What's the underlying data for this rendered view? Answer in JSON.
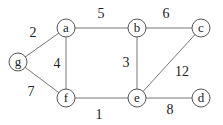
{
  "graph": {
    "nodes": [
      {
        "id": "a",
        "label": "a",
        "x": 66,
        "y": 28
      },
      {
        "id": "b",
        "label": "b",
        "x": 137,
        "y": 28
      },
      {
        "id": "c",
        "label": "c",
        "x": 201,
        "y": 28
      },
      {
        "id": "g",
        "label": "g",
        "x": 18,
        "y": 62
      },
      {
        "id": "f",
        "label": "f",
        "x": 66,
        "y": 98
      },
      {
        "id": "e",
        "label": "e",
        "x": 137,
        "y": 98
      },
      {
        "id": "d",
        "label": "d",
        "x": 201,
        "y": 98
      }
    ],
    "edges": [
      {
        "from": "a",
        "to": "b",
        "weight": "5",
        "lx": 101,
        "ly": 18
      },
      {
        "from": "b",
        "to": "c",
        "weight": "6",
        "lx": 166,
        "ly": 18
      },
      {
        "from": "g",
        "to": "a",
        "weight": "2",
        "lx": 33,
        "ly": 37
      },
      {
        "from": "a",
        "to": "f",
        "weight": "4",
        "lx": 57,
        "ly": 68
      },
      {
        "from": "g",
        "to": "f",
        "weight": "7",
        "lx": 31,
        "ly": 96
      },
      {
        "from": "b",
        "to": "e",
        "weight": "3",
        "lx": 126,
        "ly": 67
      },
      {
        "from": "e",
        "to": "c",
        "weight": "12",
        "lx": 182,
        "ly": 76
      },
      {
        "from": "f",
        "to": "e",
        "weight": "1",
        "lx": 99,
        "ly": 119
      },
      {
        "from": "e",
        "to": "d",
        "weight": "8",
        "lx": 170,
        "ly": 114
      }
    ]
  }
}
